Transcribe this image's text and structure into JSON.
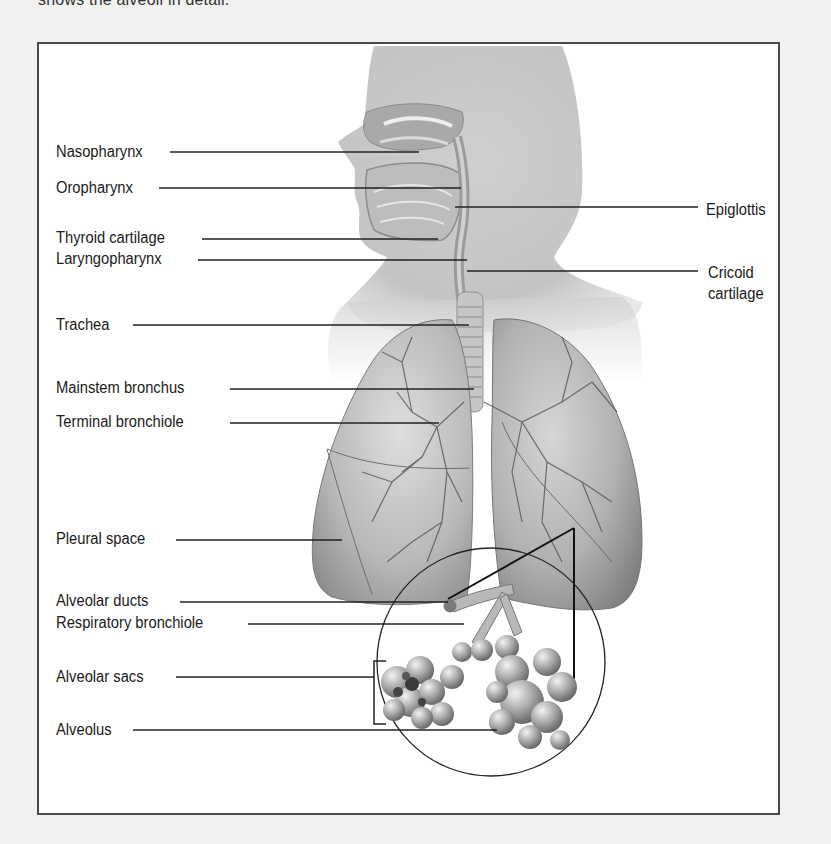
{
  "intro_text": "shows the alveoli in detail.",
  "figure": {
    "left_labels": [
      {
        "id": "nasopharynx",
        "text": "Nasopharynx",
        "x": 54,
        "y": 141,
        "line_x1": 168,
        "line_x2": 417,
        "line_y": 150
      },
      {
        "id": "oropharynx",
        "text": "Oropharynx",
        "x": 54,
        "y": 177,
        "line_x1": 157,
        "line_x2": 459,
        "line_y": 186
      },
      {
        "id": "thyroid-cartilage",
        "text": "Thyroid cartilage",
        "x": 54,
        "y": 227,
        "line_x1": 200,
        "line_x2": 436,
        "line_y": 237
      },
      {
        "id": "laryngopharynx",
        "text": "Laryngopharynx",
        "x": 54,
        "y": 248,
        "line_x1": 196,
        "line_x2": 465,
        "line_y": 258
      },
      {
        "id": "trachea",
        "text": "Trachea",
        "x": 54,
        "y": 314,
        "line_x1": 131,
        "line_x2": 467,
        "line_y": 323
      },
      {
        "id": "mainstem-bronchus",
        "text": "Mainstem bronchus",
        "x": 54,
        "y": 377,
        "line_x1": 228,
        "line_x2": 472,
        "line_y": 387
      },
      {
        "id": "terminal-bronchiole",
        "text": "Terminal bronchiole",
        "x": 54,
        "y": 411,
        "line_x1": 228,
        "line_x2": 437,
        "line_y": 421
      },
      {
        "id": "pleural-space",
        "text": "Pleural space",
        "x": 54,
        "y": 528,
        "line_x1": 174,
        "line_x2": 340,
        "line_y": 538
      },
      {
        "id": "alveolar-ducts",
        "text": "Alveolar ducts",
        "x": 54,
        "y": 590,
        "line_x1": 178,
        "line_x2": 446,
        "line_y": 600
      },
      {
        "id": "respiratory-bronchiole",
        "text": "Respiratory bronchiole",
        "x": 54,
        "y": 612,
        "line_x1": 246,
        "line_x2": 462,
        "line_y": 622
      },
      {
        "id": "alveolar-sacs",
        "text": "Alveolar sacs",
        "x": 54,
        "y": 666,
        "line_x1": 174,
        "line_x2": 372,
        "line_y": 675
      },
      {
        "id": "alveolus",
        "text": "Alveolus",
        "x": 54,
        "y": 719,
        "line_x1": 131,
        "line_x2": 495,
        "line_y": 728
      }
    ],
    "right_labels": [
      {
        "id": "epiglottis",
        "text": "Epiglottis",
        "x": 704,
        "y": 199,
        "line_x1": 453,
        "line_x2": 696,
        "line_y": 205
      },
      {
        "id": "cricoid-cartilage",
        "text": "Cricoid\ncartilage",
        "line1": "Cricoid",
        "line2": "cartilage",
        "x": 706,
        "y": 262,
        "line_x1": 465,
        "line_x2": 696,
        "line_y": 269
      }
    ],
    "magnifier": {
      "cx": 489,
      "cy": 660,
      "r": 114
    },
    "colors": {
      "page_bg": "#f1f1f0",
      "box_bg": "#ffffff",
      "box_border": "#4a4a4a",
      "leader_line": "#222222",
      "tissue_light": "#d9d9d9",
      "tissue_mid": "#b5b5b5",
      "tissue_dark": "#7a7a7a"
    }
  }
}
